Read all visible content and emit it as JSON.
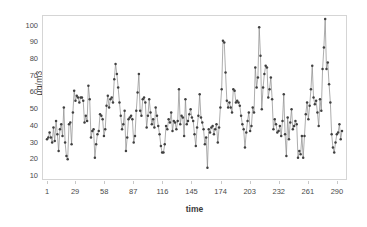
{
  "chart_data": {
    "type": "line",
    "title": "",
    "subtitle": "",
    "xlabel": "time",
    "ylabel": "µg/m3",
    "xlim": [
      1,
      295
    ],
    "ylim": [
      10,
      104
    ],
    "y_ticks": [
      10,
      20,
      30,
      40,
      50,
      60,
      70,
      80,
      90,
      100
    ],
    "x_ticks": [
      1,
      29,
      58,
      87,
      116,
      145,
      174,
      203,
      232,
      261,
      290
    ],
    "grid": false,
    "legend": null,
    "marker": "filled-circle",
    "line_color": "#8a8a8a",
    "marker_color": "#404040",
    "frame_color": "#d5d5d5",
    "series": [
      {
        "name": "PM concentration",
        "values": [
          32,
          33,
          36,
          33,
          30,
          39,
          31,
          43,
          35,
          25,
          38,
          41,
          34,
          51,
          30,
          22,
          20,
          41,
          42,
          29,
          48,
          61,
          55,
          58,
          57,
          54,
          57,
          57,
          55,
          42,
          46,
          43,
          64,
          56,
          33,
          37,
          38,
          21,
          29,
          35,
          37,
          47,
          46,
          44,
          34,
          38,
          52,
          58,
          51,
          56,
          57,
          54,
          68,
          77,
          71,
          63,
          54,
          46,
          38,
          41,
          49,
          25,
          33,
          44,
          45,
          46,
          44,
          30,
          34,
          49,
          60,
          71,
          49,
          46,
          56,
          57,
          54,
          39,
          46,
          56,
          48,
          41,
          44,
          39,
          51,
          46,
          40,
          35,
          28,
          24,
          24,
          29,
          40,
          38,
          44,
          42,
          48,
          37,
          43,
          42,
          38,
          43,
          62,
          41,
          46,
          45,
          34,
          56,
          41,
          43,
          47,
          50,
          45,
          43,
          35,
          28,
          39,
          46,
          59,
          45,
          42,
          38,
          29,
          33,
          15,
          38,
          36,
          39,
          40,
          35,
          38,
          41,
          30,
          39,
          51,
          62,
          91,
          90,
          72,
          55,
          51,
          54,
          51,
          48,
          62,
          61,
          54,
          55,
          54,
          52,
          46,
          41,
          38,
          27,
          36,
          43,
          48,
          37,
          40,
          51,
          48,
          75,
          63,
          69,
          99,
          82,
          50,
          63,
          71,
          76,
          75,
          57,
          62,
          69,
          56,
          38,
          44,
          41,
          36,
          37,
          40,
          34,
          43,
          59,
          35,
          22,
          45,
          32,
          42,
          50,
          38,
          40,
          43,
          41,
          21,
          25,
          23,
          34,
          21,
          34,
          47,
          54,
          44,
          52,
          62,
          76,
          57,
          53,
          55,
          48,
          40,
          56,
          49,
          74,
          87,
          104,
          74,
          78,
          65,
          54,
          35,
          27,
          24,
          30,
          35,
          36,
          41,
          32,
          37
        ]
      }
    ],
    "n_points": 229,
    "value_min": 15,
    "value_max": 104
  },
  "axis": {
    "y_label_text": "µg/m3",
    "x_label_text": "time"
  }
}
